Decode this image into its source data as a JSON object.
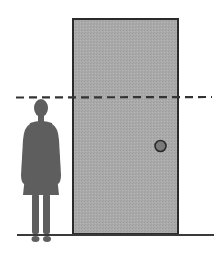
{
  "diagram": {
    "elements": [
      {
        "id": "door",
        "label": "door",
        "fill": "#a9a9a9",
        "stroke": "#2b2b2b"
      },
      {
        "id": "doorknob",
        "label": "doorknob",
        "fill": "#7a7a7a",
        "stroke": "#2b2b2b"
      },
      {
        "id": "person",
        "label": "person silhouette",
        "fill": "#5e5e5e"
      },
      {
        "id": "height-line",
        "label": "head-height dashed line",
        "stroke": "#3a3a3a"
      },
      {
        "id": "floor",
        "label": "floor line",
        "stroke": "#3a3a3a"
      }
    ]
  },
  "colors": {
    "background": "#ffffff",
    "door": "#a9a9a9",
    "outline": "#2b2b2b",
    "person": "#5e5e5e",
    "knob": "#7a7a7a"
  }
}
